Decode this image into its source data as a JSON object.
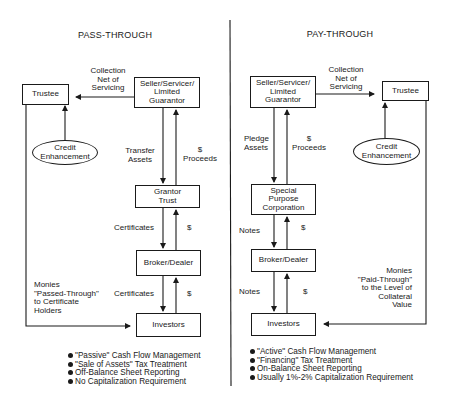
{
  "pass_through": {
    "title": "PASS-THROUGH",
    "boxes": {
      "trustee": "Trustee",
      "seller": "Seller/Servicer/\nLimited\nGuarantor",
      "credit_enhancement": "Credit\nEnhancement",
      "grantor_trust": "Grantor\nTrust",
      "broker_dealer": "Broker/Dealer",
      "investors": "Investors"
    },
    "labels": {
      "collection": "Collection\nNet of\nServicing",
      "transfer_assets": "Transfer\nAssets",
      "proceeds": "$\nProceeds",
      "certificates_1": "Certificates",
      "dollar_1": "$",
      "certificates_2": "Certificates",
      "dollar_2": "$",
      "monies": "Monies\n\"Passed-Through\"\nto Certificate\nHolders"
    },
    "bullets": [
      "\"Passive\" Cash Flow Management",
      "\"Sale of Assets\" Tax Treatment",
      "Off-Balance Sheet Reporting",
      "No Capitalization Requirement"
    ]
  },
  "pay_through": {
    "title": "PAY-THROUGH",
    "boxes": {
      "seller": "Seller/Servicer/\nLimited\nGuarantor",
      "trustee": "Trustee",
      "credit_enhancement": "Credit\nEnhancement",
      "spc": "Special\nPurpose\nCorporation",
      "broker_dealer": "Broker/Dealer",
      "investors": "Investors"
    },
    "labels": {
      "collection": "Collection\nNet of\nServicing",
      "pledge_assets": "Pledge\nAssets",
      "proceeds": "$\nProceeds",
      "notes_1": "Notes",
      "dollar_1": "$",
      "notes_2": "Notes",
      "dollar_2": "$",
      "monies": "Monies\n\"Paid-Through\"\nto the Level of\nCollateral\nValue"
    },
    "bullets": [
      "\"Active\" Cash Flow Management",
      "\"Financing\" Tax Treatment",
      "On-Balance Sheet Reporting",
      "Usually 1%-2% Capitalization Requirement"
    ]
  }
}
